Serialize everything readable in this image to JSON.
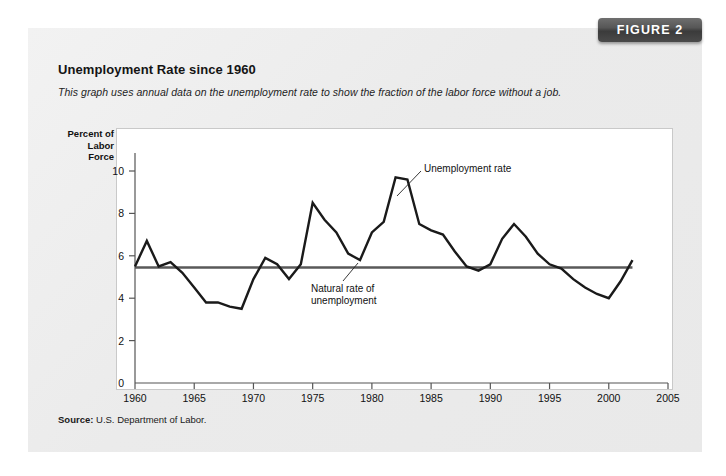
{
  "figure": {
    "badge_label": "FIGURE 2",
    "title": "Unemployment Rate since 1960",
    "subtitle": "This graph uses annual data on the unemployment rate to show the fraction of the labor force without a job.",
    "source_prefix": "Source:",
    "source_text": " U.S. Department of Labor."
  },
  "axis": {
    "y_title_line1": "Percent of",
    "y_title_line2": "Labor Force"
  },
  "annotations": {
    "unemployment_rate": "Unemployment rate",
    "natural_rate_line1": "Natural rate of",
    "natural_rate_line2": "unemployment"
  },
  "colors": {
    "badge": "#4a4a4a",
    "panel": "#ebebeb",
    "plot_bg": "#ffffff",
    "series_line": "#1a1a1a",
    "natural_rate_line": "#595959",
    "axis": "#555555"
  },
  "chart_data": {
    "type": "line",
    "title": "Unemployment Rate since 1960",
    "xlabel": "",
    "ylabel": "Percent of Labor Force",
    "xlim": [
      1960,
      2005
    ],
    "ylim": [
      0,
      10
    ],
    "grid": false,
    "legend": "none",
    "x_ticks": [
      1960,
      1965,
      1970,
      1975,
      1980,
      1985,
      1990,
      1995,
      2000,
      2005
    ],
    "y_ticks": [
      0,
      2,
      4,
      6,
      8,
      10
    ],
    "series": [
      {
        "name": "Unemployment rate",
        "x": [
          1960,
          1961,
          1962,
          1963,
          1964,
          1965,
          1966,
          1967,
          1968,
          1969,
          1970,
          1971,
          1972,
          1973,
          1974,
          1975,
          1976,
          1977,
          1978,
          1979,
          1980,
          1981,
          1982,
          1983,
          1984,
          1985,
          1986,
          1987,
          1988,
          1989,
          1990,
          1991,
          1992,
          1993,
          1994,
          1995,
          1996,
          1997,
          1998,
          1999,
          2000,
          2001,
          2002
        ],
        "values": [
          5.5,
          6.7,
          5.5,
          5.7,
          5.2,
          4.5,
          3.8,
          3.8,
          3.6,
          3.5,
          4.9,
          5.9,
          5.6,
          4.9,
          5.6,
          8.5,
          7.7,
          7.1,
          6.1,
          5.8,
          7.1,
          7.6,
          9.7,
          9.6,
          7.5,
          7.2,
          7.0,
          6.2,
          5.5,
          5.3,
          5.6,
          6.8,
          7.5,
          6.9,
          6.1,
          5.6,
          5.4,
          4.9,
          4.5,
          4.2,
          4.0,
          4.8,
          5.8
        ]
      },
      {
        "name": "Natural rate of unemployment",
        "x": [
          1960,
          2002
        ],
        "values": [
          5.45,
          5.45
        ]
      }
    ]
  }
}
